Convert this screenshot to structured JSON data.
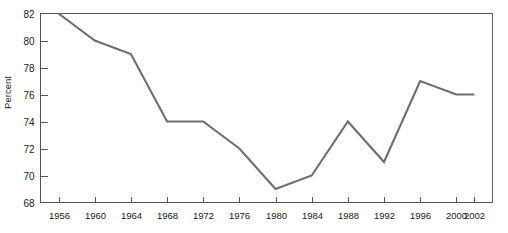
{
  "figure": {
    "cropped_title_fragment": "",
    "background_color": "#ffffff",
    "line_color": "#6e6e6e",
    "axis_color": "#555555"
  },
  "chart_data": {
    "type": "line",
    "title": "",
    "xlabel": "",
    "ylabel": "Percent",
    "categories": [
      1956,
      1960,
      1964,
      1968,
      1972,
      1976,
      1980,
      1984,
      1988,
      1992,
      1996,
      2000,
      2002
    ],
    "x_tick_labels": [
      "1956",
      "1960",
      "1964",
      "1968",
      "1972",
      "1976",
      "1980",
      "1984",
      "1988",
      "1992",
      "1996",
      "2000",
      "2002"
    ],
    "values": [
      82,
      80,
      79,
      74,
      74,
      72,
      69,
      70,
      74,
      71,
      77,
      76,
      76
    ],
    "y_tick_labels": [
      "82",
      "80",
      "78",
      "76",
      "74",
      "72",
      "70",
      "68"
    ],
    "y_ticks": [
      82,
      80,
      78,
      76,
      74,
      72,
      70,
      68
    ],
    "ylim": [
      68,
      82
    ],
    "xlim": [
      1954,
      2004
    ],
    "grid": false,
    "legend": false,
    "series": [
      {
        "name": "Percent",
        "values": [
          82,
          80,
          79,
          74,
          74,
          72,
          69,
          70,
          74,
          71,
          77,
          76,
          76
        ]
      }
    ]
  }
}
